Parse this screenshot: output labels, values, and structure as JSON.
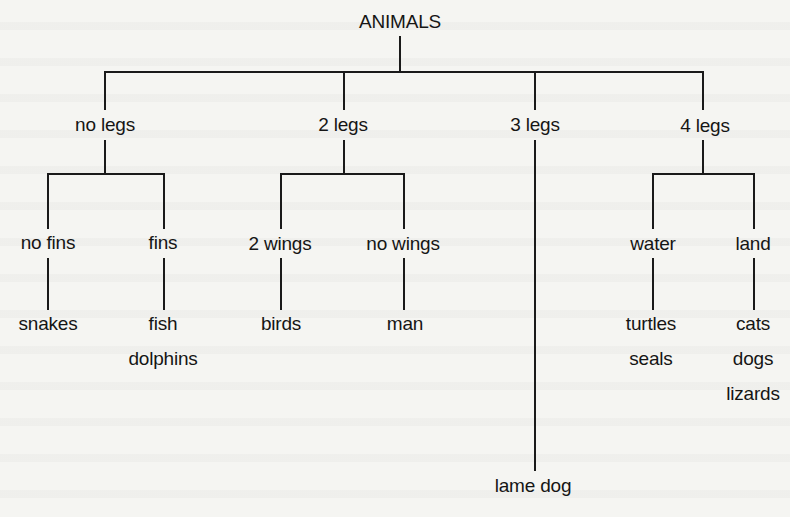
{
  "diagram": {
    "type": "tree",
    "root": "ANIMALS",
    "level1": [
      {
        "label": "no legs"
      },
      {
        "label": "2 legs"
      },
      {
        "label": "3 legs"
      },
      {
        "label": "4 legs"
      }
    ],
    "level2": [
      {
        "label": "no fins",
        "parent": "no legs"
      },
      {
        "label": "fins",
        "parent": "no legs"
      },
      {
        "label": "2 wings",
        "parent": "2 legs"
      },
      {
        "label": "no wings",
        "parent": "2 legs"
      },
      {
        "label": "water",
        "parent": "4 legs"
      },
      {
        "label": "land",
        "parent": "4 legs"
      }
    ],
    "leaves": {
      "no_fins": [
        "snakes"
      ],
      "fins": [
        "fish",
        "dolphins"
      ],
      "two_wings": [
        "birds"
      ],
      "no_wings": [
        "man"
      ],
      "three_legs": [
        "lame dog"
      ],
      "water": [
        "turtles",
        "seals"
      ],
      "land": [
        "cats",
        "dogs",
        "lizards"
      ]
    },
    "colors": {
      "background": "#f5f5f2",
      "ink": "#1a1a1a"
    }
  }
}
